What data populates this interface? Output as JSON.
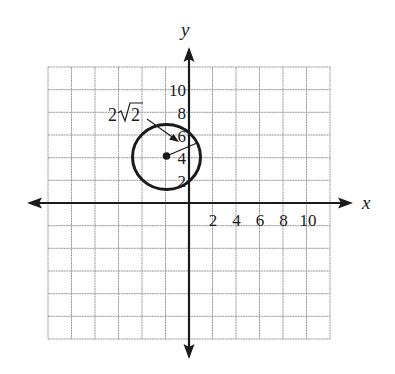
{
  "figure": {
    "axes": {
      "x_label": "x",
      "y_label": "y",
      "x_tick_labels": [
        "2",
        "4",
        "6",
        "8",
        "10"
      ],
      "y_tick_labels": [
        "2",
        "4",
        "6",
        "8",
        "10"
      ],
      "grid_step": 2,
      "x_range": [
        -12,
        12
      ],
      "y_range": [
        -12,
        12
      ]
    },
    "circle": {
      "center": [
        -2,
        4
      ],
      "radius_label_prefix": "2",
      "radius_label_root": "2",
      "radius_label": "2√2"
    },
    "colors": {
      "ink": "#1a1a1a",
      "grid": "#9a9a9a",
      "background": "#ffffff"
    }
  }
}
